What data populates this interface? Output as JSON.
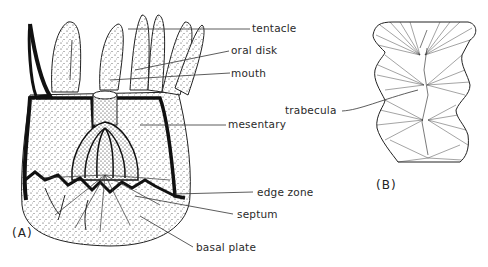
{
  "figure": {
    "panels": [
      {
        "id": "A",
        "label": "(A)"
      },
      {
        "id": "B",
        "label": "(B)"
      }
    ],
    "panel_a_labels": {
      "tentacle": "tentacle",
      "oral_disk": "oral disk",
      "mouth": "mouth",
      "mesentary": "mesentary",
      "edge_zone": "edge zone",
      "septum": "septum",
      "basal_plate": "basal plate"
    },
    "panel_b_labels": {
      "trabecula": "trabecula"
    }
  }
}
